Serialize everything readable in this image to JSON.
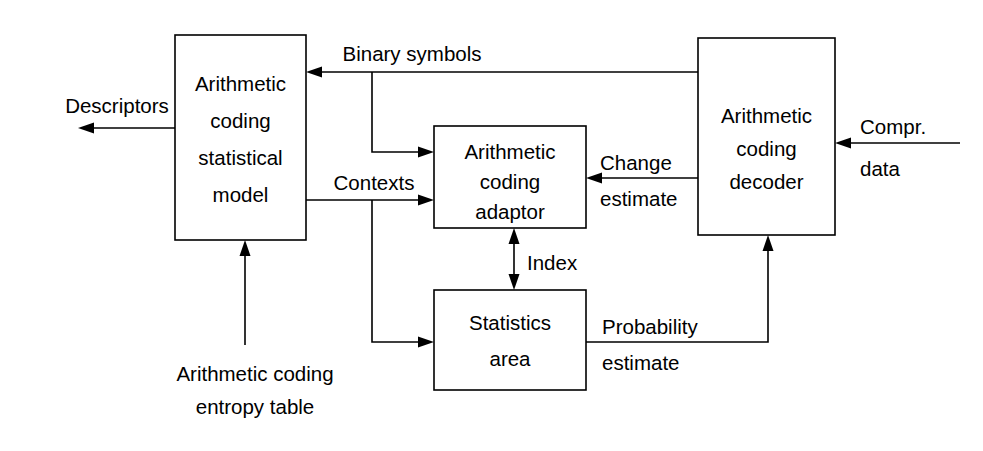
{
  "diagram": {
    "stroke_color": "#000000",
    "fill_color": "#ffffff",
    "background": "#ffffff",
    "boxes": [
      {
        "id": "statistical-model",
        "lines": [
          "Arithmetic",
          "coding",
          "statistical",
          "model"
        ]
      },
      {
        "id": "coding-adaptor",
        "lines": [
          "Arithmetic",
          "coding",
          "adaptor"
        ]
      },
      {
        "id": "statistics-area",
        "lines": [
          "Statistics",
          "area"
        ]
      },
      {
        "id": "coding-decoder",
        "lines": [
          "Arithmetic",
          "coding",
          "decoder"
        ]
      }
    ],
    "edge_labels": {
      "descriptors": "Descriptors",
      "binary_symbols": "Binary symbols",
      "contexts": "Contexts",
      "index": "Index",
      "change_line1": "Change",
      "change_line2": "estimate",
      "probability_line1": "Probability",
      "probability_line2": "estimate",
      "compr_line1": "Compr.",
      "compr_line2": "data",
      "entropy_line1": "Arithmetic coding",
      "entropy_line2": "entropy table"
    }
  }
}
